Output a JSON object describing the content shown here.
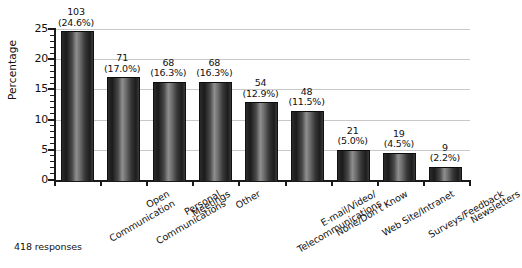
{
  "chart_data": {
    "type": "bar",
    "title": "",
    "subtitle": "",
    "xlabel": "",
    "ylabel": "Percentage",
    "ylim": [
      0,
      25
    ],
    "ytick_values": [
      0,
      5,
      10,
      15,
      20,
      25
    ],
    "ytick_labels": [
      "0",
      "5",
      "10",
      "15",
      "20",
      "25"
    ],
    "grid": true,
    "grid_axis": "y",
    "legend": false,
    "legend_position": "none",
    "categories": [
      "Open Communication",
      "Personal Communications",
      "Meetings",
      "Other",
      "E-mail/Video/Telecommunications",
      "None/Don't Know",
      "Web Site/Intranet",
      "Surveys/Feedback",
      "Newsletters"
    ],
    "category_lines": [
      [
        "Open",
        "Communication"
      ],
      [
        "Personal",
        "Communications"
      ],
      [
        "Meetings"
      ],
      [
        "Other"
      ],
      [
        "E-mail/Video/",
        "Telecommunications"
      ],
      [
        "None/Don't Know"
      ],
      [
        "Web Site/Intranet"
      ],
      [
        "Surveys/Feedback"
      ],
      [
        "Newsletters"
      ]
    ],
    "values": [
      24.6,
      17.0,
      16.3,
      16.3,
      12.9,
      11.5,
      5.0,
      4.5,
      2.2
    ],
    "counts": [
      103,
      71,
      68,
      68,
      54,
      48,
      21,
      19,
      9
    ],
    "count_labels": [
      "103",
      "71",
      "68",
      "68",
      "54",
      "48",
      "21",
      "19",
      "9"
    ],
    "percent_labels": [
      "(24.6%)",
      "(17.0%)",
      "(16.3%)",
      "(16.3%)",
      "(12.9%)",
      "(11.5%)",
      "(5.0%)",
      "(4.5%)",
      "(2.2%)"
    ],
    "annotation": "418 responses",
    "bar_color": "#333333",
    "grid_color": "#c8c8c8",
    "axis_color": "#1a1a1a",
    "background_color": "#ffffff"
  }
}
